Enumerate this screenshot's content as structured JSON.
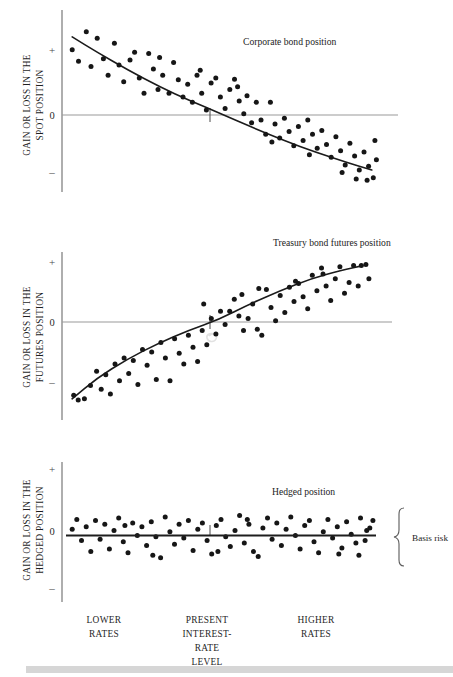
{
  "figure": {
    "title_hidden": "",
    "background": "#ffffff",
    "dot_color": "#161616",
    "curve_color": "#1b1b1b",
    "axis_color": "#8c8c8c",
    "bottom_band_color": "#d6d6d6"
  },
  "panels": [
    {
      "id": "corporate-bond",
      "title": "Corporate bond position",
      "axis_title_line1": "GAIN OR LOSS IN THE",
      "axis_title_line2": "SPOT POSITION",
      "tick_plus": "+",
      "tick_zero": "0",
      "tick_minus": "–"
    },
    {
      "id": "treasury-futures",
      "title": "Treasury bond futures position",
      "axis_title_line1": "GAIN OR LOSS IN THE",
      "axis_title_line2": "FUTURES POSITION",
      "tick_plus": "+",
      "tick_zero": "0",
      "tick_minus": "–"
    },
    {
      "id": "hedged",
      "title": "Hedged position",
      "axis_title_line1": "GAIN OR LOSS IN THE",
      "axis_title_line2": "HEDGED POSITION",
      "tick_plus": "+",
      "tick_zero": "0",
      "tick_minus": "–"
    }
  ],
  "annotations": {
    "basis_risk": "Basis risk"
  },
  "x_categories": [
    {
      "lines": [
        "LOWER",
        "RATES"
      ],
      "x": 104
    },
    {
      "lines": [
        "PRESENT",
        "INTEREST-",
        "RATE",
        "LEVEL"
      ],
      "x": 207
    },
    {
      "lines": [
        "HIGHER",
        "RATES"
      ],
      "x": 316
    }
  ],
  "chart_data": [
    {
      "type": "scatter",
      "title": "Corporate bond position",
      "xlabel": "INTEREST-RATE LEVEL",
      "ylabel": "GAIN OR LOSS IN THE SPOT POSITION",
      "xlim": [
        0,
        100
      ],
      "ylim": [
        -1.35,
        1.35
      ],
      "ytick_values": [
        1,
        0,
        -1
      ],
      "ytick_labels": [
        "+",
        "0",
        "–"
      ],
      "grid": false,
      "legend": "none",
      "trend": "decreasing-concave",
      "curve": [
        [
          2,
          1.22
        ],
        [
          10,
          0.98
        ],
        [
          20,
          0.7
        ],
        [
          30,
          0.44
        ],
        [
          40,
          0.22
        ],
        [
          50,
          0.01
        ],
        [
          60,
          -0.2
        ],
        [
          70,
          -0.4
        ],
        [
          80,
          -0.58
        ],
        [
          90,
          -0.74
        ],
        [
          98,
          -0.86
        ]
      ],
      "points": [
        [
          2.0,
          1.02
        ],
        [
          4.0,
          0.84
        ],
        [
          6.5,
          1.3
        ],
        [
          8.0,
          0.76
        ],
        [
          10.0,
          1.2
        ],
        [
          12.0,
          0.88
        ],
        [
          13.5,
          0.62
        ],
        [
          15.5,
          1.12
        ],
        [
          17.0,
          0.78
        ],
        [
          18.5,
          0.52
        ],
        [
          20.5,
          0.86
        ],
        [
          22.0,
          0.98
        ],
        [
          23.5,
          0.58
        ],
        [
          25.0,
          0.34
        ],
        [
          26.5,
          0.96
        ],
        [
          28.0,
          0.72
        ],
        [
          29.5,
          0.4
        ],
        [
          31.0,
          0.62
        ],
        [
          33.0,
          0.34
        ],
        [
          34.5,
          0.82
        ],
        [
          36.0,
          0.55
        ],
        [
          37.5,
          0.28
        ],
        [
          39.0,
          0.48
        ],
        [
          40.5,
          0.2
        ],
        [
          42.0,
          0.62
        ],
        [
          43.5,
          0.34
        ],
        [
          45.0,
          0.08
        ],
        [
          46.5,
          0.5
        ],
        [
          48.0,
          0.58
        ],
        [
          49.5,
          0.28
        ],
        [
          51.0,
          0.1
        ],
        [
          52.5,
          0.4
        ],
        [
          54.0,
          0.56
        ],
        [
          55.5,
          0.22
        ],
        [
          57.0,
          0.02
        ],
        [
          58.0,
          0.3
        ],
        [
          59.5,
          -0.12
        ],
        [
          61.0,
          0.2
        ],
        [
          62.5,
          -0.08
        ],
        [
          64.0,
          -0.3
        ],
        [
          65.5,
          0.2
        ],
        [
          67.0,
          -0.14
        ],
        [
          68.5,
          -0.36
        ],
        [
          70.0,
          -0.05
        ],
        [
          71.5,
          -0.26
        ],
        [
          73.0,
          -0.48
        ],
        [
          74.5,
          -0.18
        ],
        [
          76.0,
          -0.4
        ],
        [
          77.5,
          -0.08
        ],
        [
          79.0,
          -0.3
        ],
        [
          80.5,
          -0.52
        ],
        [
          82.0,
          -0.24
        ],
        [
          83.5,
          -0.46
        ],
        [
          85.0,
          -0.66
        ],
        [
          86.5,
          -0.34
        ],
        [
          88.0,
          -0.56
        ],
        [
          89.5,
          -0.78
        ],
        [
          91.0,
          -0.44
        ],
        [
          92.5,
          -0.64
        ],
        [
          94.0,
          -0.86
        ],
        [
          95.5,
          -0.58
        ],
        [
          97.0,
          -0.8
        ],
        [
          98.5,
          -0.98
        ],
        [
          99.5,
          -0.7
        ],
        [
          30.0,
          0.9
        ],
        [
          43.0,
          0.7
        ],
        [
          55.0,
          0.44
        ],
        [
          66.0,
          -0.42
        ],
        [
          78.0,
          -0.62
        ],
        [
          88.5,
          -0.9
        ],
        [
          93.0,
          -1.0
        ],
        [
          96.5,
          -1.02
        ],
        [
          99.0,
          -0.4
        ]
      ]
    },
    {
      "type": "scatter",
      "title": "Treasury bond futures position",
      "xlabel": "INTEREST-RATE LEVEL",
      "ylabel": "GAIN OR LOSS IN THE FUTURES POSITION",
      "xlim": [
        0,
        100
      ],
      "ylim": [
        -1.35,
        1.35
      ],
      "ytick_values": [
        1,
        0,
        -1
      ],
      "ytick_labels": [
        "+",
        "0",
        "–"
      ],
      "grid": false,
      "legend": "none",
      "trend": "increasing-concave",
      "curve": [
        [
          2,
          -1.28
        ],
        [
          10,
          -0.94
        ],
        [
          20,
          -0.62
        ],
        [
          30,
          -0.36
        ],
        [
          40,
          -0.14
        ],
        [
          50,
          0.04
        ],
        [
          60,
          0.3
        ],
        [
          70,
          0.52
        ],
        [
          80,
          0.72
        ],
        [
          90,
          0.86
        ],
        [
          97,
          0.94
        ]
      ],
      "points": [
        [
          2.5,
          -1.22
        ],
        [
          4.0,
          -1.3
        ],
        [
          6.0,
          -1.28
        ],
        [
          8.0,
          -1.06
        ],
        [
          10.0,
          -0.82
        ],
        [
          11.5,
          -1.12
        ],
        [
          13.0,
          -0.88
        ],
        [
          14.5,
          -1.2
        ],
        [
          16.0,
          -0.7
        ],
        [
          17.5,
          -0.98
        ],
        [
          19.0,
          -0.6
        ],
        [
          20.5,
          -0.86
        ],
        [
          22.0,
          -0.64
        ],
        [
          23.5,
          -1.04
        ],
        [
          25.0,
          -0.46
        ],
        [
          26.5,
          -0.72
        ],
        [
          28.0,
          -0.5
        ],
        [
          29.5,
          -0.96
        ],
        [
          31.0,
          -0.34
        ],
        [
          32.5,
          -0.6
        ],
        [
          34.0,
          -0.98
        ],
        [
          35.5,
          -0.28
        ],
        [
          37.0,
          -0.52
        ],
        [
          38.5,
          -0.7
        ],
        [
          40.0,
          -0.22
        ],
        [
          41.5,
          -0.42
        ],
        [
          43.0,
          -0.66
        ],
        [
          44.5,
          -0.14
        ],
        [
          46.0,
          -0.38
        ],
        [
          47.5,
          0.06
        ],
        [
          49.0,
          -0.2
        ],
        [
          50.5,
          0.18
        ],
        [
          52.0,
          -0.04
        ],
        [
          53.5,
          0.18
        ],
        [
          55.0,
          0.38
        ],
        [
          56.5,
          0.1
        ],
        [
          58.0,
          -0.14
        ],
        [
          59.5,
          0.06
        ],
        [
          61.0,
          0.3
        ],
        [
          62.5,
          -0.12
        ],
        [
          64.0,
          -0.22
        ],
        [
          65.5,
          0.54
        ],
        [
          67.0,
          0.24
        ],
        [
          68.5,
          0.02
        ],
        [
          70.0,
          0.44
        ],
        [
          71.5,
          0.16
        ],
        [
          73.0,
          0.58
        ],
        [
          74.5,
          0.34
        ],
        [
          76.0,
          0.64
        ],
        [
          77.5,
          0.42
        ],
        [
          79.0,
          0.22
        ],
        [
          80.5,
          0.78
        ],
        [
          82.0,
          0.52
        ],
        [
          83.5,
          0.9
        ],
        [
          85.0,
          0.6
        ],
        [
          86.5,
          0.36
        ],
        [
          88.0,
          0.72
        ],
        [
          89.5,
          0.92
        ],
        [
          91.0,
          0.48
        ],
        [
          92.5,
          0.66
        ],
        [
          94.0,
          0.94
        ],
        [
          95.5,
          0.6
        ],
        [
          96.5,
          0.94
        ],
        [
          98.0,
          0.96
        ],
        [
          99.0,
          0.72
        ],
        [
          45.0,
          0.3
        ],
        [
          57.5,
          0.46
        ],
        [
          63.0,
          0.56
        ],
        [
          75.0,
          0.68
        ],
        [
          84.0,
          0.8
        ]
      ]
    },
    {
      "type": "scatter",
      "title": "Hedged position",
      "xlabel": "INTEREST-RATE LEVEL",
      "ylabel": "GAIN OR LOSS IN THE HEDGED POSITION",
      "xlim": [
        0,
        100
      ],
      "ylim": [
        -1.35,
        1.35
      ],
      "ytick_values": [
        1,
        0,
        -1
      ],
      "ytick_labels": [
        "+",
        "0",
        "–"
      ],
      "grid": false,
      "legend": "none",
      "trend": "flat",
      "annotation": "Basis risk",
      "curve": [
        [
          0,
          -0.04
        ],
        [
          100,
          -0.04
        ]
      ],
      "points": [
        [
          2.0,
          0.06
        ],
        [
          3.5,
          0.22
        ],
        [
          5.0,
          -0.12
        ],
        [
          6.5,
          0.1
        ],
        [
          8.0,
          -0.3
        ],
        [
          9.5,
          0.2
        ],
        [
          11.0,
          -0.1
        ],
        [
          12.5,
          0.14
        ],
        [
          14.0,
          -0.26
        ],
        [
          15.5,
          0.04
        ],
        [
          17.0,
          0.24
        ],
        [
          18.5,
          -0.14
        ],
        [
          20.0,
          -0.32
        ],
        [
          21.5,
          0.16
        ],
        [
          23.0,
          -0.04
        ],
        [
          24.5,
          0.1
        ],
        [
          26.0,
          -0.2
        ],
        [
          27.5,
          0.18
        ],
        [
          29.0,
          -0.06
        ],
        [
          30.5,
          -0.4
        ],
        [
          32.0,
          0.26
        ],
        [
          33.5,
          0.02
        ],
        [
          35.0,
          -0.18
        ],
        [
          36.5,
          0.14
        ],
        [
          38.0,
          -0.08
        ],
        [
          39.5,
          0.2
        ],
        [
          41.0,
          -0.28
        ],
        [
          42.5,
          0.06
        ],
        [
          44.0,
          0.16
        ],
        [
          45.5,
          -0.12
        ],
        [
          47.0,
          -0.34
        ],
        [
          48.5,
          0.12
        ],
        [
          50.0,
          0.22
        ],
        [
          51.5,
          -0.06
        ],
        [
          53.0,
          -0.22
        ],
        [
          54.5,
          0.04
        ],
        [
          56.0,
          0.28
        ],
        [
          57.5,
          -0.16
        ],
        [
          59.0,
          0.14
        ],
        [
          60.5,
          -0.3
        ],
        [
          62.0,
          -0.38
        ],
        [
          63.5,
          0.08
        ],
        [
          65.0,
          0.24
        ],
        [
          66.5,
          -0.1
        ],
        [
          68.0,
          0.16
        ],
        [
          69.5,
          -0.2
        ],
        [
          71.0,
          0.06
        ],
        [
          72.5,
          0.26
        ],
        [
          74.0,
          -0.04
        ],
        [
          75.5,
          -0.26
        ],
        [
          77.0,
          0.12
        ],
        [
          78.5,
          0.2
        ],
        [
          80.0,
          -0.14
        ],
        [
          81.5,
          -0.32
        ],
        [
          83.0,
          0.02
        ],
        [
          84.5,
          0.22
        ],
        [
          86.0,
          -0.08
        ],
        [
          87.5,
          0.1
        ],
        [
          89.0,
          -0.24
        ],
        [
          90.5,
          0.18
        ],
        [
          92.0,
          -0.02
        ],
        [
          93.5,
          -0.16
        ],
        [
          95.0,
          0.24
        ],
        [
          96.5,
          -0.12
        ],
        [
          98.0,
          0.08
        ],
        [
          99.0,
          0.2
        ],
        [
          19.0,
          0.12
        ],
        [
          28.0,
          -0.36
        ],
        [
          49.0,
          -0.3
        ],
        [
          58.5,
          0.22
        ],
        [
          88.0,
          -0.34
        ],
        [
          94.5,
          -0.36
        ],
        [
          97.0,
          0.04
        ]
      ]
    }
  ]
}
